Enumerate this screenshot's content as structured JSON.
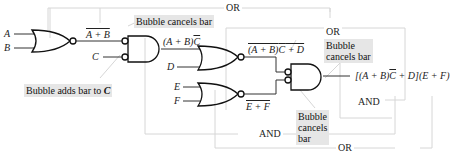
{
  "inputs": {
    "a": "A",
    "b": "B",
    "c": "C",
    "d": "D",
    "e": "E",
    "f": "F"
  },
  "signals": {
    "nor1_out": "A + B",
    "and1_out_prefix": "(A + B)",
    "and1_out_bar": "C",
    "nor2_out_prefix": "(A + B)",
    "nor2_out_bar": "C",
    "nor2_out_suffix": " + D",
    "nor3_out": "E + F",
    "final_out_prefix": "[(A + B)",
    "final_out_bar": "C",
    "final_out_suffix": " + D](E + F)"
  },
  "annotations": {
    "bubble_adds_bar_prefix": "Bubble adds bar to ",
    "bubble_adds_bar_var": "C",
    "bubble_cancels_bar_1": "Bubble cancels bar",
    "bubble_cancels_bar_2_line1": "Bubble",
    "bubble_cancels_bar_2_line2": "cancels bar",
    "bubble_cancels_bar_3_line1": "Bubble",
    "bubble_cancels_bar_3_line2": "cancels",
    "bubble_cancels_bar_3_line3": "bar"
  },
  "group_labels": {
    "or_top": "OR",
    "or_mid": "OR",
    "and_mid": "AND",
    "and_bottom": "AND",
    "or_bottom": "OR"
  },
  "colors": {
    "gate_stroke": "#111111",
    "group_box": "#d8d8d8",
    "note_bg": "#e6e6e6"
  }
}
